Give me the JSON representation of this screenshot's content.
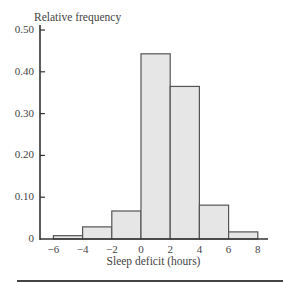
{
  "chart_data": {
    "type": "bar",
    "title": "",
    "xlabel": "Sleep deficit (hours)",
    "ylabel": "Relative frequency",
    "bins": [
      [
        -6,
        -4
      ],
      [
        -4,
        -2
      ],
      [
        -2,
        0
      ],
      [
        0,
        2
      ],
      [
        2,
        4
      ],
      [
        4,
        6
      ],
      [
        6,
        8
      ]
    ],
    "categories": [
      "-6 to -4",
      "-4 to -2",
      "-2 to 0",
      "0 to 2",
      "2 to 4",
      "4 to 6",
      "6 to 8"
    ],
    "values": [
      0.008,
      0.029,
      0.067,
      0.443,
      0.365,
      0.081,
      0.017
    ],
    "xticks": [
      -6,
      -4,
      -2,
      0,
      2,
      4,
      6,
      8
    ],
    "xtick_labels": [
      "−6",
      "−4",
      "−2",
      "0",
      "2",
      "4",
      "6",
      "8"
    ],
    "yticks": [
      0,
      0.1,
      0.2,
      0.3,
      0.4,
      0.5
    ],
    "ytick_labels": [
      "0",
      "0.10",
      "0.20",
      "0.30",
      "0.40",
      "0.50"
    ],
    "xlim": [
      -7,
      9
    ],
    "ylim": [
      0,
      0.5
    ],
    "grid": false,
    "legend": null,
    "bar_fill": "#e6e6e6",
    "bar_edge": "#555555"
  }
}
